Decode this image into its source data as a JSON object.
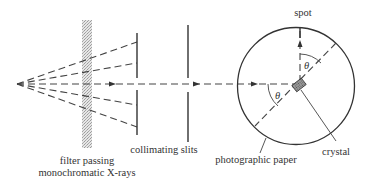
{
  "diagram": {
    "labels": {
      "filter": [
        "filter passing",
        "monochromatic X-rays"
      ],
      "slits": "collimating slits",
      "paper": "photographic paper",
      "crystal": "crystal",
      "spot": "spot",
      "theta": "θ"
    },
    "colors": {
      "ink": "#333333",
      "filter_fill": "#cfcfcf",
      "crystal_fill": "#8a8a8a",
      "background": "#ffffff"
    }
  }
}
